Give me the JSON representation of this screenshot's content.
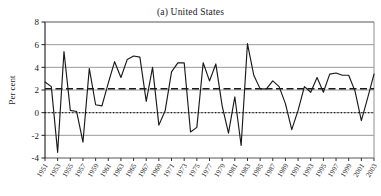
{
  "figure": {
    "title": "(a) United States",
    "axis_label_y": "Per cent"
  },
  "chart_data": {
    "type": "line",
    "title": "(a) United States",
    "xlabel": "",
    "ylabel": "Per cent",
    "ylim": [
      -4,
      8
    ],
    "xlim": [
      1951,
      2003
    ],
    "yticks": [
      -4,
      -2,
      0,
      2,
      4,
      6,
      8
    ],
    "ytick_labels": [
      "-4",
      "-2",
      "0",
      "2",
      "4",
      "6",
      "8"
    ],
    "xticks": [
      1951,
      1953,
      1955,
      1957,
      1959,
      1961,
      1963,
      1965,
      1967,
      1969,
      1971,
      1973,
      1975,
      1977,
      1979,
      1981,
      1983,
      1985,
      1987,
      1989,
      1991,
      1993,
      1995,
      1997,
      1999,
      2001,
      2003
    ],
    "xtick_labels": [
      "1951",
      "1953",
      "1955",
      "1957",
      "1959",
      "1961",
      "1963",
      "1965",
      "1967",
      "1969",
      "1971",
      "1973",
      "1975",
      "1977",
      "1979",
      "1981",
      "1983",
      "1985",
      "1987",
      "1989",
      "1991",
      "1993",
      "1995",
      "1997",
      "1999",
      "2001",
      "2003"
    ],
    "grid": true,
    "grid_axis": "y",
    "legend_position": "none",
    "x": [
      1951,
      1952,
      1953,
      1954,
      1955,
      1956,
      1957,
      1958,
      1959,
      1960,
      1961,
      1962,
      1963,
      1964,
      1965,
      1966,
      1967,
      1968,
      1969,
      1970,
      1971,
      1972,
      1973,
      1974,
      1975,
      1976,
      1977,
      1978,
      1979,
      1980,
      1981,
      1982,
      1983,
      1984,
      1985,
      1986,
      1987,
      1988,
      1989,
      1990,
      1991,
      1992,
      1993,
      1994,
      1995,
      1996,
      1997,
      1998,
      1999,
      2000,
      2001,
      2002,
      2003
    ],
    "series": [
      {
        "name": "US growth rate",
        "style": "solid",
        "color": "#1a1a1a",
        "values": [
          2.7,
          2.3,
          -3.5,
          5.4,
          0.2,
          0.1,
          -2.6,
          3.9,
          0.7,
          0.6,
          2.6,
          4.5,
          3.1,
          4.7,
          5.0,
          4.9,
          1.0,
          4.0,
          -1.1,
          0.2,
          3.6,
          4.4,
          4.4,
          -1.7,
          -1.3,
          4.4,
          2.8,
          4.3,
          0.6,
          -1.8,
          1.4,
          -2.9,
          6.1,
          3.3,
          2.1,
          2.1,
          2.8,
          2.3,
          0.8,
          -1.5,
          0.2,
          2.3,
          1.8,
          3.1,
          1.8,
          3.4,
          3.5,
          3.3,
          3.3,
          1.9,
          -0.7,
          1.3,
          3.4
        ]
      },
      {
        "name": "Mean growth rate",
        "style": "dashed",
        "color": "#1a1a1a",
        "constant": 2.1
      },
      {
        "name": "Zero line",
        "style": "dotted",
        "color": "#1a1a1a",
        "constant": 0
      }
    ]
  }
}
